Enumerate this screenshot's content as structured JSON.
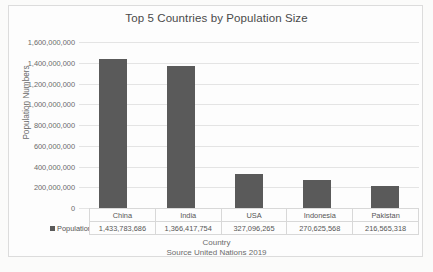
{
  "chart_data": {
    "type": "bar",
    "title": "Top 5 Countries by Population Size",
    "xlabel": "Country",
    "ylabel": "Population Numbers",
    "categories": [
      "China",
      "India",
      "USA",
      "Indonesia",
      "Pakistan"
    ],
    "values": [
      1433783686,
      1366417754,
      327096265,
      270625568,
      216565318
    ],
    "value_labels": [
      "1,433,783,686",
      "1,366,417,754",
      "327,096,265",
      "270,625,568",
      "216,565,318"
    ],
    "series": [
      {
        "name": "Population",
        "values": [
          1433783686,
          1366417754,
          327096265,
          270625568,
          216565318
        ]
      }
    ],
    "ylim": [
      0,
      1600000000
    ],
    "ytick_values": [
      1600000000,
      1400000000,
      1200000000,
      1000000000,
      800000000,
      600000000,
      400000000,
      200000000,
      0
    ],
    "ytick_labels": [
      "1,600,000,000",
      "1,400,000,000",
      "1,200,000,000",
      "1,000,000,000",
      "800,000,000",
      "600,000,000",
      "400,000,000",
      "200,000,000",
      "0"
    ],
    "grid": true,
    "legend": {
      "position": "data-table-left",
      "entries": [
        "Population"
      ]
    },
    "data_table_visible": true,
    "annotations": [
      "Source United Nations 2019"
    ],
    "colors": {
      "bar": "#5a5a5a",
      "gridline": "#e4e4e4",
      "text": "#595959",
      "frame": "#dcdcdc"
    }
  },
  "source_note": "Source United Nations 2019",
  "legend_label": "Population"
}
